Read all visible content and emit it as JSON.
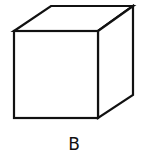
{
  "figure": {
    "shape": "cube",
    "label": "B",
    "stroke_color": "#111111",
    "background": "#ffffff"
  }
}
